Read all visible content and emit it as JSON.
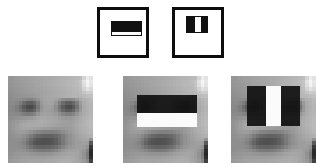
{
  "figure": {
    "background_color": "#ffffff",
    "width": 316,
    "height": 167,
    "caption": ""
  },
  "palette": {
    "stroke": "#0d0d0d",
    "dark_rect": "#111111",
    "light_rect": "#fbfbfb",
    "panel_background": "#9a9a9a",
    "page_background": "#ffffff"
  },
  "prototypes": [
    {
      "id": "two-rectangle-horizontal",
      "name": "Two-rectangle feature (horizontal, edge)",
      "label": "",
      "box": {
        "x": 97,
        "y": 7,
        "w": 52,
        "h": 51
      },
      "inner": {
        "x": 11,
        "y": 11,
        "w": 31,
        "h": 15
      },
      "bands": [
        {
          "role": "dark",
          "orientation": "horizontal",
          "x": 0,
          "y": 0,
          "w": 31,
          "h": 10,
          "color": "#111111"
        },
        {
          "role": "light",
          "orientation": "horizontal",
          "x": 0,
          "y": 10,
          "w": 31,
          "h": 5,
          "color": "#fbfbfb"
        }
      ]
    },
    {
      "id": "three-rectangle-vertical",
      "name": "Three-rectangle feature (vertical, line)",
      "label": "",
      "box": {
        "x": 172,
        "y": 7,
        "w": 52,
        "h": 51
      },
      "inner": {
        "x": 11,
        "y": 6,
        "w": 22,
        "h": 17
      },
      "bands": [
        {
          "role": "dark",
          "orientation": "vertical",
          "x": 0,
          "y": 0,
          "w": 8,
          "h": 17,
          "color": "#111111"
        },
        {
          "role": "light",
          "orientation": "vertical",
          "x": 8,
          "y": 0,
          "w": 6,
          "h": 17,
          "color": "#fbfbfb"
        },
        {
          "role": "dark",
          "orientation": "vertical",
          "x": 14,
          "y": 0,
          "w": 8,
          "h": 17,
          "color": "#111111"
        }
      ]
    }
  ],
  "face_panels": [
    {
      "id": "face-plain",
      "name": "Training face, no feature overlay",
      "label": "",
      "box": {
        "x": 8,
        "y": 76,
        "w": 85,
        "h": 87
      },
      "overlays": []
    },
    {
      "id": "face-two-rectangle",
      "name": "Face with two-rectangle eye feature overlay",
      "label": "",
      "box": {
        "x": 123,
        "y": 76,
        "w": 85,
        "h": 87
      },
      "overlays": [
        {
          "role": "dark",
          "x": 14,
          "y": 19,
          "w": 60,
          "h": 18,
          "color": "#111111"
        },
        {
          "role": "light",
          "x": 14,
          "y": 37,
          "w": 60,
          "h": 14,
          "color": "#fbfbfb"
        }
      ]
    },
    {
      "id": "face-three-rectangle",
      "name": "Face with three-rectangle eye feature overlay",
      "label": "",
      "box": {
        "x": 231,
        "y": 76,
        "w": 85,
        "h": 87
      },
      "overlays": [
        {
          "role": "dark",
          "x": 16,
          "y": 10,
          "w": 19,
          "h": 40,
          "color": "#111111"
        },
        {
          "role": "light",
          "x": 35,
          "y": 10,
          "w": 15,
          "h": 40,
          "color": "#fbfbfb"
        },
        {
          "role": "dark",
          "x": 50,
          "y": 10,
          "w": 19,
          "h": 40,
          "color": "#111111"
        }
      ]
    }
  ],
  "face_image": {
    "description": "Low-resolution grayscale frontal face, 24x24 sample grid",
    "grid_width": 24,
    "grid_height": 24,
    "pixels": [
      [
        150,
        152,
        156,
        158,
        158,
        160,
        162,
        162,
        164,
        166,
        168,
        168,
        170,
        172,
        174,
        176,
        178,
        180,
        182,
        184,
        188,
        212,
        236,
        226
      ],
      [
        150,
        152,
        154,
        156,
        158,
        160,
        162,
        164,
        164,
        166,
        168,
        170,
        172,
        174,
        176,
        178,
        180,
        182,
        184,
        188,
        196,
        226,
        246,
        232
      ],
      [
        148,
        150,
        152,
        154,
        156,
        158,
        160,
        162,
        164,
        166,
        168,
        170,
        172,
        174,
        176,
        178,
        180,
        182,
        184,
        186,
        194,
        222,
        242,
        228
      ],
      [
        146,
        148,
        150,
        152,
        154,
        156,
        158,
        160,
        162,
        164,
        166,
        168,
        170,
        172,
        174,
        176,
        178,
        180,
        182,
        184,
        190,
        210,
        226,
        218
      ],
      [
        144,
        146,
        148,
        150,
        152,
        154,
        156,
        158,
        160,
        162,
        164,
        166,
        168,
        170,
        172,
        174,
        176,
        178,
        180,
        182,
        186,
        196,
        206,
        204
      ],
      [
        142,
        144,
        146,
        148,
        148,
        150,
        152,
        154,
        158,
        162,
        164,
        166,
        168,
        170,
        172,
        174,
        176,
        178,
        180,
        180,
        182,
        186,
        190,
        192
      ],
      [
        140,
        142,
        142,
        140,
        136,
        132,
        130,
        134,
        146,
        158,
        164,
        166,
        166,
        162,
        152,
        142,
        136,
        136,
        142,
        154,
        168,
        176,
        180,
        184
      ],
      [
        138,
        138,
        134,
        124,
        108,
        96,
        92,
        102,
        126,
        152,
        162,
        164,
        162,
        150,
        128,
        108,
        96,
        94,
        104,
        126,
        154,
        172,
        178,
        182
      ],
      [
        136,
        134,
        126,
        110,
        90,
        76,
        74,
        88,
        118,
        148,
        158,
        160,
        156,
        142,
        116,
        92,
        78,
        76,
        90,
        116,
        148,
        170,
        176,
        180
      ],
      [
        136,
        134,
        128,
        116,
        100,
        90,
        90,
        102,
        128,
        152,
        158,
        158,
        154,
        144,
        124,
        104,
        92,
        92,
        104,
        128,
        152,
        170,
        176,
        180
      ],
      [
        138,
        138,
        136,
        132,
        126,
        122,
        124,
        132,
        148,
        160,
        162,
        160,
        158,
        154,
        144,
        132,
        126,
        126,
        134,
        148,
        162,
        172,
        178,
        182
      ],
      [
        142,
        144,
        146,
        148,
        150,
        152,
        154,
        158,
        164,
        168,
        168,
        166,
        164,
        162,
        158,
        154,
        152,
        152,
        156,
        162,
        170,
        176,
        180,
        184
      ],
      [
        146,
        150,
        154,
        158,
        162,
        164,
        166,
        168,
        170,
        172,
        170,
        168,
        166,
        164,
        162,
        160,
        158,
        158,
        160,
        166,
        172,
        178,
        182,
        186
      ],
      [
        148,
        152,
        158,
        164,
        168,
        170,
        170,
        170,
        170,
        170,
        168,
        166,
        164,
        162,
        160,
        158,
        158,
        158,
        162,
        168,
        174,
        178,
        182,
        186
      ],
      [
        148,
        152,
        158,
        162,
        166,
        166,
        164,
        162,
        160,
        158,
        156,
        154,
        152,
        152,
        152,
        152,
        154,
        156,
        160,
        166,
        172,
        176,
        180,
        184
      ],
      [
        146,
        150,
        154,
        156,
        156,
        152,
        146,
        140,
        134,
        130,
        128,
        128,
        128,
        130,
        134,
        140,
        146,
        152,
        158,
        164,
        170,
        174,
        178,
        182
      ],
      [
        144,
        146,
        148,
        148,
        144,
        136,
        124,
        112,
        104,
        100,
        98,
        98,
        100,
        104,
        112,
        124,
        136,
        146,
        154,
        160,
        166,
        170,
        174,
        176
      ],
      [
        142,
        144,
        144,
        142,
        136,
        124,
        108,
        94,
        86,
        82,
        80,
        82,
        86,
        94,
        108,
        122,
        136,
        146,
        152,
        158,
        162,
        166,
        168,
        146
      ],
      [
        142,
        142,
        142,
        138,
        130,
        116,
        100,
        88,
        82,
        80,
        80,
        82,
        86,
        94,
        106,
        120,
        134,
        144,
        150,
        156,
        158,
        160,
        158,
        90
      ],
      [
        142,
        142,
        142,
        140,
        136,
        126,
        114,
        104,
        100,
        98,
        98,
        100,
        104,
        110,
        120,
        132,
        142,
        150,
        154,
        158,
        158,
        156,
        146,
        58
      ],
      [
        144,
        144,
        146,
        146,
        144,
        140,
        134,
        128,
        124,
        122,
        122,
        124,
        128,
        134,
        142,
        150,
        156,
        160,
        162,
        162,
        158,
        150,
        132,
        44
      ],
      [
        146,
        148,
        150,
        152,
        152,
        152,
        150,
        148,
        146,
        146,
        146,
        148,
        150,
        154,
        158,
        162,
        164,
        166,
        166,
        164,
        158,
        146,
        124,
        40
      ],
      [
        150,
        152,
        154,
        156,
        158,
        158,
        158,
        158,
        158,
        158,
        158,
        160,
        162,
        164,
        166,
        168,
        170,
        170,
        168,
        164,
        158,
        148,
        128,
        48
      ],
      [
        154,
        156,
        158,
        160,
        162,
        164,
        164,
        164,
        164,
        164,
        166,
        166,
        168,
        170,
        172,
        172,
        174,
        172,
        170,
        166,
        160,
        152,
        136,
        64
      ]
    ]
  }
}
